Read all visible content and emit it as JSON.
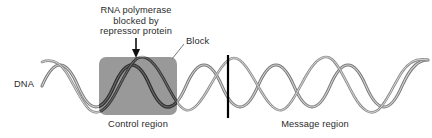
{
  "figure": {
    "kind": "dna-transcription-repressor-diagram",
    "background_color": "#ffffff"
  },
  "labels": {
    "callout_title_line1": "RNA polymerase",
    "callout_title_line2": "blocked by",
    "callout_title_line3": "repressor protein",
    "block": "Block",
    "dna": "DNA",
    "control_region": "Control region",
    "message_region": "Message region"
  },
  "colors": {
    "text": "#2b2b2b",
    "panel_fill": "#999999",
    "strand_light": "#b9b9b9",
    "strand_dark": "#6e6e6e",
    "strand_on_panel": "#333333",
    "bar": "#000000",
    "leader_line": "#6a6a6a"
  },
  "geometry": {
    "width": 432,
    "height": 138,
    "helix_center_y": 86,
    "helix_amplitude": 28,
    "helix_period": 48,
    "helix_start_x": 42,
    "helix_end_x": 428,
    "panel_x": 99,
    "panel_y": 57,
    "panel_width": 78,
    "panel_height": 58,
    "panel_corner_radius": 7,
    "arrow_x": 136,
    "arrow_top_y": 38,
    "arrow_bottom_y": 57,
    "bar_x": 228,
    "bar_top_y": 55,
    "bar_bottom_y": 118,
    "leader_from_x": 184,
    "leader_from_y": 44,
    "leader_to_x": 172,
    "leader_to_y": 59
  }
}
